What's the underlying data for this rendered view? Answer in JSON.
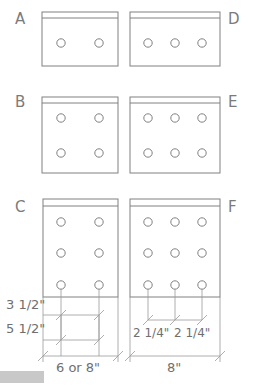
{
  "drawing": {
    "title": "Nail plate / connector plate hole patterns",
    "stroke_color": "#808080",
    "text_color": "#6f6f6f",
    "background": "#ffffff",
    "accent_gray": "#c8c8c8"
  },
  "labels": {
    "a": "A",
    "b": "B",
    "c": "C",
    "d": "D",
    "e": "E",
    "f": "F"
  },
  "panels": [
    {
      "key": "a",
      "label": "A",
      "label_side": "left",
      "rows": 1,
      "cols": 2,
      "x": 42,
      "y": 12,
      "width": 76,
      "height": 54,
      "band_height": 6
    },
    {
      "key": "d",
      "label": "D",
      "label_side": "right",
      "rows": 1,
      "cols": 3,
      "x": 130,
      "y": 12,
      "width": 90,
      "height": 54,
      "band_height": 6
    },
    {
      "key": "b",
      "label": "B",
      "label_side": "left",
      "rows": 2,
      "cols": 2,
      "x": 42,
      "y": 97,
      "width": 76,
      "height": 76,
      "band_height": 6
    },
    {
      "key": "e",
      "label": "E",
      "label_side": "right",
      "rows": 2,
      "cols": 3,
      "x": 130,
      "y": 97,
      "width": 90,
      "height": 76,
      "band_height": 6
    },
    {
      "key": "c",
      "label": "C",
      "label_side": "left",
      "rows": 3,
      "cols": 2,
      "x": 43,
      "y": 199,
      "width": 75,
      "height": 98,
      "band_height": 7
    },
    {
      "key": "f",
      "label": "F",
      "label_side": "right",
      "rows": 3,
      "cols": 3,
      "x": 130,
      "y": 199,
      "width": 90,
      "height": 98,
      "band_height": 7
    }
  ],
  "dimensions": {
    "vertical_spacing_1": "3 1/2\"",
    "vertical_spacing_2": "5 1/2\"",
    "overall_width_left": "6 or 8\"",
    "hole_spacing_1": "2 1/4\"",
    "hole_spacing_2": "2 1/4\"",
    "overall_width_right": "8\""
  },
  "hole": {
    "radius": 4.2,
    "stroke": "#808080"
  }
}
